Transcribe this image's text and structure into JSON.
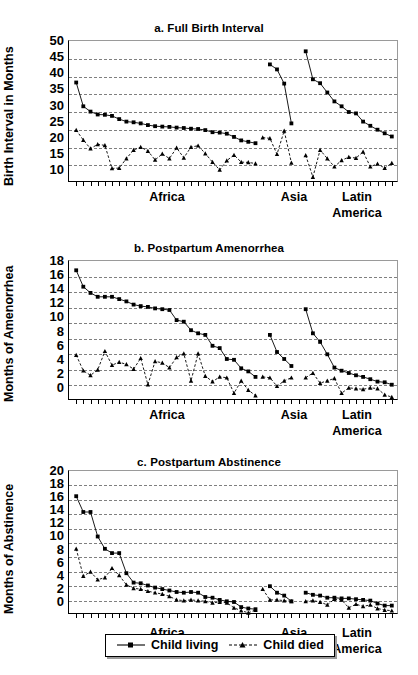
{
  "figure": {
    "background": "#ffffff",
    "ink": "#000000",
    "gridline_color": "#555555"
  },
  "legend": {
    "position": "bottom-center",
    "items": [
      {
        "label": "Child living",
        "marker": "square",
        "line": "solid"
      },
      {
        "label": "Child died",
        "marker": "triangle",
        "line": "dashed"
      }
    ]
  },
  "region_axis": {
    "labels": [
      "Africa",
      "Asia",
      "Latin"
    ],
    "second_line": "America"
  },
  "chart_data": [
    {
      "id": "a",
      "type": "line",
      "title": "a. Full Birth Interval",
      "xlabel": "",
      "ylabel": "Birth Interval in Months",
      "ylim": [
        10,
        50
      ],
      "yticks": [
        10,
        15,
        20,
        25,
        30,
        35,
        40,
        45,
        50
      ],
      "grid": true,
      "grid_axis": "y",
      "legend_position": "figure-bottom",
      "x_group_labels": [
        "Africa",
        "Asia",
        "Latin America"
      ],
      "n_ticks": 45,
      "series": [
        {
          "name": "Child living",
          "marker": "square",
          "line": "solid",
          "groups": [
            {
              "region": "Africa",
              "x": [
                1,
                2,
                3,
                4,
                5,
                6,
                7,
                8,
                9,
                10,
                11,
                12,
                13,
                14,
                15,
                16,
                17,
                18,
                19,
                20,
                21,
                22,
                23,
                24,
                25,
                26
              ],
              "values": [
                38.3,
                31.6,
                30.1,
                29.3,
                29.2,
                28.9,
                28.0,
                27.3,
                27.1,
                26.8,
                26.3,
                26.0,
                25.9,
                25.8,
                25.6,
                25.5,
                25.3,
                25.2,
                24.9,
                24.3,
                24.2,
                23.9,
                23.0,
                22.0,
                21.6,
                21.2
              ]
            },
            {
              "region": "Asia",
              "x": [
                28,
                29,
                30,
                31
              ],
              "values": [
                43.4,
                42.0,
                38.0,
                26.8
              ]
            },
            {
              "region": "Latin America",
              "x": [
                33,
                34,
                35,
                36,
                37,
                38,
                39,
                40,
                41,
                42,
                43,
                44,
                45
              ],
              "values": [
                47.1,
                39.2,
                38.1,
                35.5,
                33.0,
                31.6,
                30.0,
                29.6,
                27.3,
                26.1,
                25.0,
                24.0,
                23.1
              ]
            }
          ]
        },
        {
          "name": "Child died",
          "marker": "triangle",
          "line": "dashed",
          "groups": [
            {
              "region": "Africa",
              "x": [
                1,
                2,
                3,
                4,
                5,
                6,
                7,
                8,
                9,
                10,
                11,
                12,
                13,
                14,
                15,
                16,
                17,
                18,
                19,
                20,
                21,
                22,
                23,
                24,
                25,
                26
              ],
              "values": [
                24.9,
                22.1,
                19.7,
                20.9,
                20.6,
                14.1,
                14.2,
                16.9,
                19.3,
                20.1,
                19.0,
                16.5,
                18.2,
                16.9,
                19.9,
                17.1,
                20.1,
                20.5,
                18.3,
                15.9,
                13.7,
                16.3,
                17.9,
                15.9,
                15.8,
                15.5
              ]
            },
            {
              "region": "Asia",
              "x": [
                27,
                28,
                29,
                30,
                31
              ],
              "values": [
                22.8,
                22.6,
                18.1,
                24.7,
                15.7
              ]
            },
            {
              "region": "Latin America",
              "x": [
                33,
                34,
                35,
                36,
                37,
                38,
                39,
                40,
                41,
                42,
                43,
                44,
                45
              ],
              "values": [
                17.8,
                11.7,
                19.3,
                16.9,
                14.6,
                16.4,
                17.3,
                17.0,
                18.8,
                14.6,
                15.4,
                14.2,
                15.6
              ]
            }
          ]
        }
      ]
    },
    {
      "id": "b",
      "type": "line",
      "title": "b. Postpartum Amenorrhea",
      "xlabel": "",
      "ylabel": "Months of Amenorrhea",
      "ylim": [
        0,
        18
      ],
      "yticks": [
        0,
        2,
        4,
        6,
        8,
        10,
        12,
        14,
        16,
        18
      ],
      "grid": true,
      "grid_axis": "y",
      "x_group_labels": [
        "Africa",
        "Asia",
        "Latin America"
      ],
      "n_ticks": 45,
      "series": [
        {
          "name": "Child living",
          "marker": "square",
          "line": "solid",
          "groups": [
            {
              "region": "Africa",
              "x": [
                1,
                2,
                3,
                4,
                5,
                6,
                7,
                8,
                9,
                10,
                11,
                12,
                13,
                14,
                15,
                16,
                17,
                18,
                19,
                20,
                21,
                22,
                23,
                24,
                25,
                26
              ],
              "values": [
                16.8,
                14.7,
                13.9,
                13.4,
                13.4,
                13.4,
                13.1,
                12.8,
                12.4,
                12.2,
                12.1,
                11.9,
                11.8,
                11.7,
                10.4,
                10.2,
                9.1,
                8.7,
                8.5,
                7.1,
                6.8,
                5.4,
                5.3,
                4.2,
                3.8,
                3.1
              ]
            },
            {
              "region": "Asia",
              "x": [
                28,
                29,
                30,
                31
              ],
              "values": [
                8.5,
                6.3,
                5.4,
                4.5
              ]
            },
            {
              "region": "Latin America",
              "x": [
                33,
                34,
                35,
                36,
                37,
                38,
                39,
                40,
                41,
                42,
                43,
                44,
                45
              ],
              "values": [
                11.8,
                8.7,
                7.6,
                6.0,
                4.3,
                3.9,
                3.6,
                3.3,
                3.1,
                2.8,
                2.5,
                2.4,
                2.1
              ]
            }
          ]
        },
        {
          "name": "Child died",
          "marker": "triangle",
          "line": "dashed",
          "groups": [
            {
              "region": "Africa",
              "x": [
                1,
                2,
                3,
                4,
                5,
                6,
                7,
                8,
                9,
                10,
                11,
                12,
                13,
                14,
                15,
                16,
                17,
                18,
                19,
                20,
                21,
                22,
                23,
                24,
                25,
                26
              ],
              "values": [
                5.9,
                3.9,
                3.3,
                4.0,
                6.4,
                4.6,
                5.0,
                4.7,
                4.1,
                5.5,
                2.1,
                5.1,
                4.9,
                4.3,
                5.6,
                6.1,
                2.6,
                6.1,
                3.2,
                2.5,
                3.1,
                3.0,
                1.0,
                2.6,
                1.4,
                0.7
              ]
            },
            {
              "region": "Asia",
              "x": [
                27,
                28,
                29,
                30,
                31
              ],
              "values": [
                3.1,
                3.0,
                1.9,
                2.6,
                3.0
              ]
            },
            {
              "region": "Latin America",
              "x": [
                33,
                34,
                35,
                36,
                37,
                38,
                39,
                40,
                41,
                42,
                43,
                44,
                45
              ],
              "values": [
                3.0,
                3.6,
                2.3,
                2.6,
                2.9,
                1.0,
                1.7,
                1.6,
                1.5,
                1.7,
                1.6,
                0.8,
                0.5
              ]
            }
          ]
        }
      ]
    },
    {
      "id": "c",
      "type": "line",
      "title": "c. Postpartum Abstinence",
      "xlabel": "",
      "ylabel": "Months of Abstinence",
      "ylim": [
        0,
        20
      ],
      "yticks": [
        0,
        2,
        4,
        6,
        8,
        10,
        12,
        14,
        16,
        18,
        20
      ],
      "grid": true,
      "grid_axis": "y",
      "x_group_labels": [
        "Africa",
        "Asia",
        "Latin America"
      ],
      "n_ticks": 45,
      "series": [
        {
          "name": "Child living",
          "marker": "square",
          "line": "solid",
          "groups": [
            {
              "region": "Africa",
              "x": [
                1,
                2,
                3,
                4,
                5,
                6,
                7,
                8,
                9,
                10,
                11,
                12,
                13,
                14,
                15,
                16,
                17,
                18,
                19,
                20,
                21,
                22,
                23,
                24,
                25,
                26
              ],
              "values": [
                16.5,
                14.3,
                14.3,
                10.9,
                9.2,
                8.6,
                8.6,
                5.8,
                4.5,
                4.4,
                4.1,
                3.8,
                3.6,
                3.4,
                3.2,
                3.1,
                3.2,
                3.1,
                2.5,
                2.4,
                2.1,
                1.9,
                1.8,
                1.1,
                0.9,
                0.8
              ]
            },
            {
              "region": "Asia",
              "x": [
                28,
                29,
                30,
                31
              ],
              "values": [
                4.0,
                3.1,
                2.7,
                1.9
              ]
            },
            {
              "region": "Latin America",
              "x": [
                33,
                34,
                35,
                36,
                37,
                38,
                39,
                40,
                41,
                42,
                43,
                44,
                45
              ],
              "values": [
                3.1,
                2.8,
                2.7,
                2.4,
                2.4,
                2.3,
                2.3,
                2.2,
                2.1,
                2.0,
                1.6,
                1.3,
                1.3
              ]
            }
          ]
        },
        {
          "name": "Child died",
          "marker": "triangle",
          "line": "dashed",
          "groups": [
            {
              "region": "Africa",
              "x": [
                1,
                2,
                3,
                4,
                5,
                6,
                7,
                8,
                9,
                10,
                11,
                12,
                13,
                14,
                15,
                16,
                17,
                18,
                19,
                20,
                21,
                22,
                23,
                24,
                25,
                26
              ],
              "values": [
                9.2,
                5.4,
                6.0,
                4.9,
                5.2,
                6.5,
                5.5,
                4.2,
                3.7,
                3.6,
                3.3,
                3.1,
                2.9,
                2.6,
                2.1,
                2.0,
                2.1,
                2.0,
                1.9,
                1.7,
                1.8,
                1.7,
                1.0,
                0.6,
                0.3,
                0.7
              ]
            },
            {
              "region": "Asia",
              "x": [
                27,
                28,
                29,
                30,
                31
              ],
              "values": [
                3.6,
                2.1,
                2.1,
                2.0,
                1.9
              ]
            },
            {
              "region": "Latin America",
              "x": [
                33,
                34,
                35,
                36,
                37,
                38,
                39,
                40,
                41,
                42,
                43,
                44,
                45
              ],
              "values": [
                1.9,
                2.0,
                1.8,
                1.4,
                2.2,
                2.1,
                1.0,
                1.5,
                1.2,
                1.4,
                0.9,
                0.7,
                0.6
              ]
            }
          ]
        }
      ]
    }
  ]
}
